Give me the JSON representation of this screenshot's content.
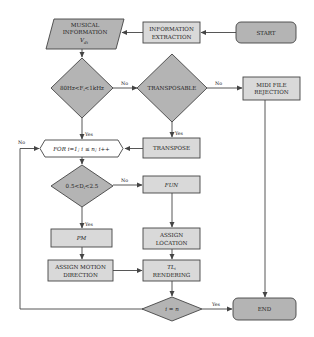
{
  "diagram": {
    "type": "flowchart",
    "colors": {
      "terminal_fill": "#b4b4b4",
      "decision_fill": "#b4b4b4",
      "process_fill": "#d9d9d9",
      "stroke": "#444444"
    },
    "nodes": {
      "start": {
        "label": "START",
        "shape": "rounded-rect"
      },
      "info_extraction": {
        "line1": "INFORMATION",
        "line2": "EXTRACTION",
        "shape": "rect"
      },
      "musical_info": {
        "line1": "MUSICAL",
        "line2": "INFORMATION",
        "line3": "V",
        "line3_sub": "di",
        "shape": "parallelogram"
      },
      "freq_check": {
        "label": "80Hz<F",
        "label_sub": "i",
        "label_tail": "<1kHz",
        "shape": "diamond"
      },
      "transposable": {
        "label": "TRANSPOSABLE",
        "shape": "diamond"
      },
      "midi_rejection": {
        "line1": "MIDI FILE",
        "line2": "REJECTION",
        "shape": "rect"
      },
      "for_loop": {
        "label": "FOR i=1; i ≤ n; i++",
        "shape": "hexagon"
      },
      "transpose": {
        "label": "TRANSPOSE",
        "shape": "rect"
      },
      "duration_check": {
        "label": "0.5<D",
        "label_sub": "i",
        "label_tail": "<2.5",
        "shape": "diamond"
      },
      "fun": {
        "label": "FUN",
        "shape": "rect"
      },
      "pm": {
        "label": "PM",
        "shape": "rect"
      },
      "assign_location": {
        "line1": "ASSIGN",
        "line2": "LOCATION",
        "shape": "rect"
      },
      "assign_motion": {
        "line1": "ASSIGN MOTION",
        "line2": "DIRECTION",
        "shape": "rect"
      },
      "tl_rendering": {
        "line1": "TL",
        "line1_sub": "i",
        "line2": "RENDERING",
        "shape": "rect"
      },
      "i_eq_n": {
        "label": "i = n",
        "shape": "diamond"
      },
      "end": {
        "label": "END",
        "shape": "rounded-rect"
      }
    },
    "edge_labels": {
      "freq_no": "No",
      "freq_yes": "Yes",
      "transposable_no": "No",
      "transposable_yes": "Yes",
      "duration_no": "No",
      "duration_yes": "Yes",
      "loop_no": "No",
      "loop_yes": "Yes"
    },
    "edges": [
      {
        "from": "start",
        "to": "info_extraction"
      },
      {
        "from": "info_extraction",
        "to": "musical_info"
      },
      {
        "from": "musical_info",
        "to": "freq_check"
      },
      {
        "from": "freq_check",
        "to": "transposable",
        "label": "No"
      },
      {
        "from": "freq_check",
        "to": "for_loop",
        "label": "Yes"
      },
      {
        "from": "transposable",
        "to": "midi_rejection",
        "label": "No"
      },
      {
        "from": "transposable",
        "to": "transpose",
        "label": "Yes"
      },
      {
        "from": "transpose",
        "to": "for_loop"
      },
      {
        "from": "midi_rejection",
        "to": "end"
      },
      {
        "from": "for_loop",
        "to": "duration_check"
      },
      {
        "from": "duration_check",
        "to": "fun",
        "label": "No"
      },
      {
        "from": "duration_check",
        "to": "pm",
        "label": "Yes"
      },
      {
        "from": "fun",
        "to": "assign_location"
      },
      {
        "from": "pm",
        "to": "assign_motion"
      },
      {
        "from": "assign_location",
        "to": "tl_rendering"
      },
      {
        "from": "assign_motion",
        "to": "tl_rendering"
      },
      {
        "from": "tl_rendering",
        "to": "i_eq_n"
      },
      {
        "from": "i_eq_n",
        "to": "end",
        "label": "Yes"
      },
      {
        "from": "i_eq_n",
        "to": "for_loop",
        "label": "No"
      }
    ]
  }
}
